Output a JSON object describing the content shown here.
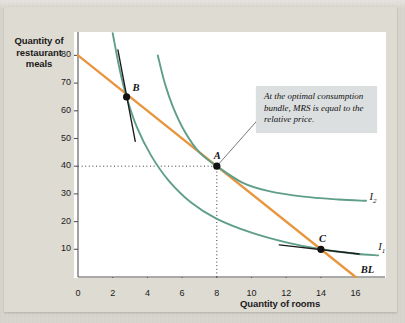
{
  "chart_data": {
    "type": "line",
    "title": "",
    "xlabel": "Quantity of rooms",
    "ylabel": "Quantity of restaurant meals",
    "xlim": [
      0,
      17.7
    ],
    "ylim": [
      0,
      88
    ],
    "xticks": [
      "0",
      "2",
      "4",
      "6",
      "8",
      "10",
      "12",
      "14",
      "16"
    ],
    "xtick_values": [
      0,
      2,
      4,
      6,
      8,
      10,
      12,
      14,
      16
    ],
    "yticks": [
      "10",
      "20",
      "30",
      "40",
      "50",
      "60",
      "70",
      "80"
    ],
    "ytick_values": [
      10,
      20,
      30,
      40,
      50,
      60,
      70,
      80
    ],
    "grid": false,
    "legend_position": "inline-right",
    "series": [
      {
        "name": "BL",
        "label": "BL",
        "kind": "budget-line",
        "color": "#e8963f",
        "points": [
          [
            0,
            80
          ],
          [
            16,
            0
          ]
        ]
      },
      {
        "name": "I1",
        "label": "I",
        "label_sub": "1",
        "kind": "indifference-curve",
        "color": "#5f9e88",
        "points": [
          [
            2.0,
            88
          ],
          [
            2.4,
            75
          ],
          [
            2.8,
            65
          ],
          [
            3.4,
            54
          ],
          [
            4.2,
            44
          ],
          [
            5.2,
            35
          ],
          [
            6.5,
            27
          ],
          [
            8.0,
            21
          ],
          [
            10.0,
            16
          ],
          [
            12.0,
            12.5
          ],
          [
            14.0,
            10.0
          ],
          [
            16.0,
            8.4
          ],
          [
            17.3,
            7.8
          ]
        ]
      },
      {
        "name": "I2",
        "label": "I",
        "label_sub": "2",
        "kind": "indifference-curve",
        "color": "#5f9e88",
        "points": [
          [
            4.6,
            80
          ],
          [
            5.0,
            70
          ],
          [
            5.5,
            61
          ],
          [
            6.2,
            52
          ],
          [
            7.0,
            45
          ],
          [
            8.0,
            40
          ],
          [
            9.5,
            34
          ],
          [
            11.0,
            31
          ],
          [
            13.0,
            29
          ],
          [
            15.0,
            28
          ],
          [
            16.6,
            27.5
          ]
        ]
      },
      {
        "name": "tangent-at-B",
        "kind": "tangent-line",
        "color": "#1a1a1a",
        "points": [
          [
            2.3,
            82
          ],
          [
            3.3,
            49
          ]
        ]
      },
      {
        "name": "tangent-at-C",
        "kind": "tangent-line",
        "color": "#1a1a1a",
        "points": [
          [
            11.6,
            11.6
          ],
          [
            16.2,
            8.3
          ]
        ]
      }
    ],
    "points": [
      {
        "label": "A",
        "x": 8,
        "y": 40,
        "label_dx": -3,
        "label_dy": -16
      },
      {
        "label": "B",
        "x": 2.8,
        "y": 65,
        "label_dx": 6,
        "label_dy": -15
      },
      {
        "label": "C",
        "x": 14,
        "y": 10,
        "label_dx": -2,
        "label_dy": -16
      }
    ],
    "dotted_guides": [
      {
        "name": "horizontal-guide-40",
        "from": [
          0,
          40
        ],
        "to": [
          8,
          40
        ]
      },
      {
        "name": "vertical-guide-8",
        "from": [
          8,
          0
        ],
        "to": [
          8,
          40
        ]
      }
    ],
    "annotations": [
      {
        "name": "optimal-bundle-callout",
        "text": "At the optimal consumption bundle, MRS is equal to the relative price.",
        "leader_from": [
          8,
          40
        ],
        "leader_to": [
          10.4,
          57
        ]
      }
    ],
    "colors": {
      "budget_line": "#e8963f",
      "indifference_curve": "#5f9e88",
      "tangent": "#1a1a1a",
      "axis": "#555555",
      "plot_background": "#ffffff",
      "page_background": "#d8d5cd",
      "callout_background": "#dcdfe0"
    }
  },
  "labels": {
    "y_axis_title": "Quantity of restaurant meals",
    "y_axis_title_lines": [
      "Quantity of",
      "restaurant",
      "meals"
    ],
    "x_axis_title": "Quantity of rooms",
    "callout_text": "At the optimal consumption bundle, MRS is equal to the relative price.",
    "curve_I1": "I",
    "curve_I1_sub": "1",
    "curve_I2": "I",
    "curve_I2_sub": "2",
    "budget_line_label": "BL",
    "point_A": "A",
    "point_B": "B",
    "point_C": "C"
  }
}
